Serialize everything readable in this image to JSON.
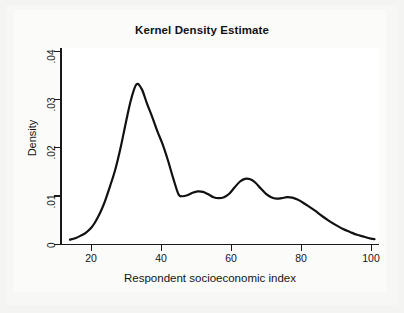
{
  "chart_data": {
    "type": "line",
    "title": "Kernel Density Estimate",
    "xlabel": "Respondent socioeconomic index",
    "ylabel": "Density",
    "xlim": [
      13.5,
      101.5
    ],
    "ylim": [
      0,
      0.042
    ],
    "grid": false,
    "legend": null,
    "line_color": "#111111",
    "xticks": [
      20,
      40,
      60,
      80,
      100
    ],
    "xtick_labels": [
      "20",
      "40",
      "60",
      "80",
      "100"
    ],
    "yticks": [
      0,
      0.01,
      0.02,
      0.03,
      0.04
    ],
    "ytick_labels": [
      "0",
      ".01",
      ".02",
      ".03",
      ".04"
    ],
    "series": [
      {
        "name": "Density",
        "x": [
          14.0,
          15.5,
          17.0,
          18.5,
          20.0,
          21.0,
          22.0,
          23.0,
          24.0,
          25.5,
          27.0,
          28.5,
          30.0,
          31.5,
          33.0,
          34.5,
          36.0,
          37.5,
          39.0,
          40.5,
          42.0,
          43.5,
          45.0,
          46.0,
          47.5,
          49.0,
          50.5,
          52.0,
          53.5,
          55.0,
          56.5,
          58.0,
          59.5,
          61.0,
          62.5,
          64.0,
          65.5,
          67.0,
          68.5,
          70.0,
          71.5,
          73.0,
          74.5,
          76.0,
          77.5,
          79.0,
          80.5,
          82.0,
          84.0,
          86.0,
          88.0,
          90.0,
          92.0,
          94.0,
          96.0,
          98.0,
          100.0,
          101.0
        ],
        "y": [
          0.0008,
          0.0011,
          0.0016,
          0.0022,
          0.0032,
          0.0042,
          0.0055,
          0.007,
          0.0088,
          0.012,
          0.0155,
          0.02,
          0.0252,
          0.03,
          0.033,
          0.032,
          0.029,
          0.0262,
          0.0232,
          0.0205,
          0.0172,
          0.0135,
          0.0102,
          0.0098,
          0.01,
          0.0105,
          0.0108,
          0.0107,
          0.0102,
          0.0096,
          0.0094,
          0.0096,
          0.0103,
          0.0116,
          0.0128,
          0.0134,
          0.0133,
          0.0126,
          0.0114,
          0.0103,
          0.0096,
          0.0093,
          0.0094,
          0.0096,
          0.0095,
          0.0091,
          0.0085,
          0.0078,
          0.0068,
          0.0057,
          0.0047,
          0.0038,
          0.003,
          0.0024,
          0.0018,
          0.0014,
          0.001,
          0.0009
        ]
      }
    ],
    "annotations": []
  },
  "chart": {
    "title": "Kernel Density Estimate",
    "xlabel": "Respondent socioeconomic index",
    "ylabel": "Density",
    "xtick_labels": [
      "20",
      "40",
      "60",
      "80",
      "100"
    ],
    "ytick_labels": [
      "0",
      ".01",
      ".02",
      ".03",
      ".04"
    ]
  }
}
